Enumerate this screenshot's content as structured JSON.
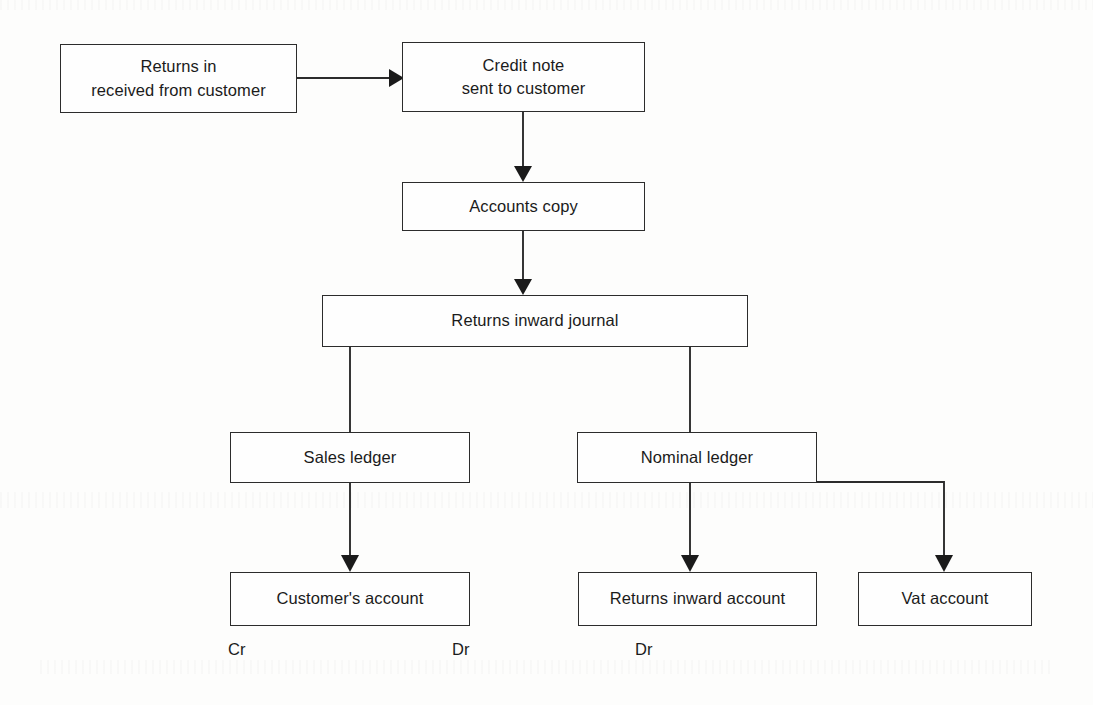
{
  "diagram": {
    "background_color": "#fdfdfc",
    "line_color": "#2c2c2c",
    "text_color": "#1b1b1b",
    "nodes": [
      {
        "id": "returns-in",
        "label": "Returns in\nreceived from customer",
        "line1": "Returns in",
        "line2": "received from customer",
        "x": 60,
        "y": 44,
        "w": 237,
        "h": 69
      },
      {
        "id": "credit-note",
        "label": "Credit note\nsent to customer",
        "line1": "Credit note",
        "line2": "sent to customer",
        "x": 402,
        "y": 42,
        "w": 243,
        "h": 70
      },
      {
        "id": "accounts-copy",
        "label": "Accounts copy",
        "line1": "Accounts copy",
        "line2": "",
        "x": 402,
        "y": 182,
        "w": 243,
        "h": 49
      },
      {
        "id": "returns-inward-journal",
        "label": "Returns inward journal",
        "line1": "Returns inward journal",
        "line2": "",
        "x": 322,
        "y": 295,
        "w": 426,
        "h": 52
      },
      {
        "id": "sales-ledger",
        "label": "Sales ledger",
        "line1": "Sales ledger",
        "line2": "",
        "x": 230,
        "y": 432,
        "w": 240,
        "h": 51
      },
      {
        "id": "nominal-ledger",
        "label": "Nominal ledger",
        "line1": "Nominal ledger",
        "line2": "",
        "x": 577,
        "y": 432,
        "w": 240,
        "h": 51
      },
      {
        "id": "customers-account",
        "label": "Customer's account",
        "line1": "Customer's account",
        "line2": "",
        "x": 230,
        "y": 572,
        "w": 240,
        "h": 54
      },
      {
        "id": "returns-inward-account",
        "label": "Returns inward account",
        "line1": "Returns inward account",
        "line2": "",
        "x": 578,
        "y": 572,
        "w": 239,
        "h": 54
      },
      {
        "id": "vat-account",
        "label": "Vat account",
        "line1": "Vat account",
        "line2": "",
        "x": 858,
        "y": 572,
        "w": 174,
        "h": 54
      }
    ],
    "captions": [
      {
        "id": "cr-customers-account",
        "text": "Cr",
        "x": 228,
        "y": 648
      },
      {
        "id": "dr-returns-inward-account",
        "text": "Dr",
        "x": 452,
        "y": 648
      },
      {
        "id": "dr-vat-account",
        "text": "Dr",
        "x": 635,
        "y": 648
      }
    ],
    "connectors": [
      {
        "id": "returns-in-to-credit-note",
        "from": "returns-in",
        "to": "credit-note",
        "kind": "horizontal-arrow"
      },
      {
        "id": "credit-note-to-accounts-copy",
        "from": "credit-note",
        "to": "accounts-copy",
        "kind": "vertical-arrow"
      },
      {
        "id": "accounts-copy-to-journal",
        "from": "accounts-copy",
        "to": "returns-inward-journal",
        "kind": "vertical-arrow"
      },
      {
        "id": "journal-to-sales-ledger",
        "from": "returns-inward-journal",
        "to": "sales-ledger",
        "kind": "vertical-plain"
      },
      {
        "id": "journal-to-nominal-ledger",
        "from": "returns-inward-journal",
        "to": "nominal-ledger",
        "kind": "vertical-plain"
      },
      {
        "id": "sales-ledger-to-customers-account",
        "from": "sales-ledger",
        "to": "customers-account",
        "kind": "vertical-arrow"
      },
      {
        "id": "nominal-ledger-to-returns-inward-account",
        "from": "nominal-ledger",
        "to": "returns-inward-account",
        "kind": "vertical-arrow"
      },
      {
        "id": "nominal-ledger-to-vat-account",
        "from": "nominal-ledger",
        "to": "vat-account",
        "kind": "elbow-arrow"
      }
    ]
  }
}
